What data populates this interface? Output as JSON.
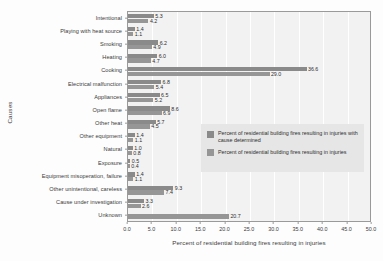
{
  "chart_data": {
    "type": "bar",
    "orientation": "horizontal",
    "title": "",
    "xlabel": "Percent of residential building fires resulting in injuries",
    "ylabel": "Causes",
    "xlim": [
      0.0,
      50.0
    ],
    "xticks": [
      "0.0",
      "5.0",
      "10.0",
      "15.0",
      "20.0",
      "25.0",
      "30.0",
      "35.0",
      "40.0",
      "45.0",
      "50.0"
    ],
    "grid": true,
    "grid_axis": "x",
    "legend_position": "center-right",
    "categories": [
      "Intentional",
      "Playing with heat source",
      "Smoking",
      "Heating",
      "Cooking",
      "Electrical malfunction",
      "Appliances",
      "Open flame",
      "Other heat",
      "Other equipment",
      "Natural",
      "Exposure",
      "Equipment misoperation, failure",
      "Other unintentional, careless",
      "Cause under investigation",
      "Unknown"
    ],
    "series": [
      {
        "name": "Percent of residential building fires resulting in injuries with cause determined",
        "color": "#8a8a8a",
        "values": [
          5.3,
          1.4,
          6.2,
          6.0,
          36.6,
          6.8,
          6.5,
          8.6,
          5.7,
          1.4,
          1.0,
          0.5,
          1.4,
          9.3,
          3.3,
          null
        ],
        "labels": [
          "5.3",
          "1.4",
          "6.2",
          "6.0",
          "36.6",
          "6.8",
          "6.5",
          "8.6",
          "5.7",
          "1.4",
          "1.0",
          "0.5",
          "1.4",
          "9.3",
          "3.3",
          ""
        ]
      },
      {
        "name": "Percent of residential building fires resulting in injuries",
        "color": "#969696",
        "values": [
          4.2,
          1.1,
          4.9,
          4.7,
          29.0,
          5.4,
          5.2,
          6.9,
          4.5,
          1.1,
          0.8,
          0.4,
          1.1,
          7.4,
          2.6,
          20.7
        ],
        "labels": [
          "4.2",
          "1.1",
          "4.9",
          "4.7",
          "29.0",
          "5.4",
          "5.2",
          "6.9",
          "4.5",
          "1.1",
          "0.8",
          "0.4",
          "1.1",
          "7.4",
          "2.6",
          "20.7"
        ]
      }
    ]
  },
  "legend": {
    "items": [
      {
        "label": "Percent of residential building fires resulting in injuries with cause determined"
      },
      {
        "label": "Percent of residential building fires resulting in injuries"
      }
    ]
  },
  "colors": {
    "series1": "#8a8a8a",
    "series2": "#969696",
    "plot_background": "#f2f2f2",
    "legend_background": "#e6e6e6",
    "gridline": "#ffffff",
    "axis": "#9a9a9a",
    "text": "#3a3a3a"
  }
}
